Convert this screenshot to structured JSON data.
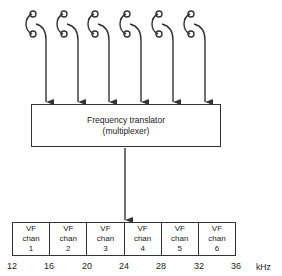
{
  "diagram": {
    "translator": {
      "line1": "Frequency translator",
      "line2": "(multiplexer)"
    },
    "telephones": 6,
    "channels": [
      {
        "l1": "VF",
        "l2": "chan",
        "n": "1"
      },
      {
        "l1": "VF",
        "l2": "chan",
        "n": "2"
      },
      {
        "l1": "VF",
        "l2": "chan",
        "n": "3"
      },
      {
        "l1": "VF",
        "l2": "chan",
        "n": "4"
      },
      {
        "l1": "VF",
        "l2": "chan",
        "n": "5"
      },
      {
        "l1": "VF",
        "l2": "chan",
        "n": "6"
      }
    ],
    "ticks": [
      "12",
      "16",
      "20",
      "24",
      "28",
      "32",
      "36"
    ],
    "unit": "kHz"
  }
}
